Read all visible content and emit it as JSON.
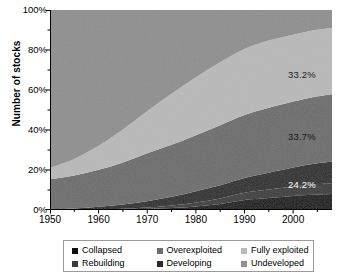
{
  "chart_data": {
    "type": "area",
    "title": "",
    "subtitle": "",
    "xlabel": "",
    "ylabel": "Number of stocks",
    "xlim": [
      1950,
      2008
    ],
    "ylim": [
      0,
      100
    ],
    "grid": false,
    "stacked": true,
    "stack_order": "bottom-to-top",
    "legend_position": "bottom",
    "x_tick_labels": [
      "1950",
      "1960",
      "1970",
      "1980",
      "1990",
      "2000"
    ],
    "x_tick_values": [
      1950,
      1960,
      1970,
      1980,
      1990,
      2000
    ],
    "x_minor_tick_step": 5,
    "y_tick_labels": [
      "0%",
      "20%",
      "40%",
      "60%",
      "80%",
      "100%"
    ],
    "y_tick_values": [
      0,
      20,
      40,
      60,
      80,
      100
    ],
    "y_minor_tick_step": 10,
    "x": [
      1950,
      1955,
      1960,
      1965,
      1970,
      1975,
      1980,
      1985,
      1990,
      1995,
      2000,
      2004,
      2008
    ],
    "series": [
      {
        "name": "Collapsed",
        "color": "#0d0d0d",
        "values": [
          0.0,
          0.0,
          0.0,
          0.2,
          0.5,
          1.0,
          1.8,
          3.0,
          5.0,
          6.0,
          7.0,
          7.6,
          8.0
        ]
      },
      {
        "name": "Rebuilding",
        "color": "#3a3a3a",
        "values": [
          0.0,
          0.0,
          0.2,
          0.4,
          0.7,
          1.2,
          2.0,
          2.8,
          3.6,
          4.2,
          4.8,
          5.2,
          5.4
        ]
      },
      {
        "name": "Developing",
        "color": "#2a2a2a",
        "values": [
          0.4,
          0.8,
          1.4,
          2.2,
          3.2,
          4.4,
          5.6,
          6.6,
          7.4,
          8.4,
          9.4,
          10.2,
          10.8
        ]
      },
      {
        "name": "Overexploited",
        "color": "#6d6d6d",
        "values": [
          15.0,
          16.5,
          18.5,
          21.0,
          24.0,
          26.0,
          28.0,
          30.0,
          31.5,
          32.5,
          33.0,
          33.4,
          33.7
        ]
      },
      {
        "name": "Fully exploited",
        "color": "#b9b9b9",
        "values": [
          5.6,
          8.2,
          12.0,
          16.5,
          21.0,
          25.5,
          29.0,
          31.5,
          33.0,
          33.6,
          33.4,
          33.3,
          33.2
        ]
      },
      {
        "name": "Undeveloped",
        "color": "#8f8f8f",
        "values": [
          79.0,
          74.5,
          67.9,
          59.7,
          50.6,
          41.9,
          33.6,
          26.1,
          19.5,
          15.3,
          12.4,
          10.3,
          8.9
        ]
      }
    ],
    "annotations": [
      {
        "label": "33.2%",
        "series": "Fully exploited",
        "x_px": 288,
        "y_px": 69,
        "color": "#1a1a1a"
      },
      {
        "label": "33.7%",
        "series": "Overexploited",
        "x_px": 288,
        "y_px": 131,
        "color": "#151515"
      },
      {
        "label": "24.2%",
        "series": "Collapsed+Rebuilding+Developing",
        "x_px": 288,
        "y_px": 179,
        "color": "#ffffff"
      }
    ]
  },
  "axes": {
    "y_title": "Number of stocks",
    "y_ticks": [
      "100%",
      "80%",
      "60%",
      "40%",
      "20%",
      "0%"
    ],
    "x_ticks": [
      "1950",
      "1960",
      "1970",
      "1980",
      "1990",
      "2000"
    ]
  },
  "legend": {
    "rows": [
      [
        {
          "label": "Collapsed",
          "color": "#0d0d0d"
        },
        {
          "label": "Overexploited",
          "color": "#6d6d6d"
        },
        {
          "label": "Fully exploited",
          "color": "#b9b9b9"
        }
      ],
      [
        {
          "label": "Rebuilding",
          "color": "#3a3a3a"
        },
        {
          "label": "Developing",
          "color": "#2a2a2a"
        },
        {
          "label": "Undeveloped",
          "color": "#8f8f8f"
        }
      ]
    ]
  }
}
